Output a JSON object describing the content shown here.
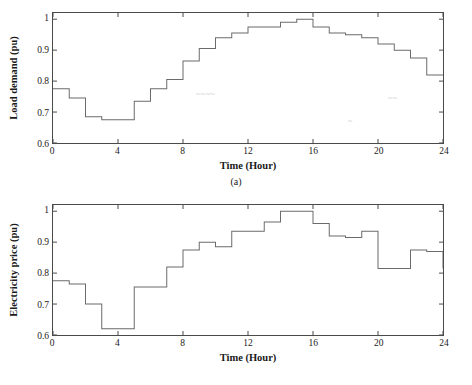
{
  "figure": {
    "panels": [
      {
        "id": "a",
        "caption": "(a)",
        "xlabel": "Time (Hour)",
        "ylabel": "Load demand (pu)",
        "xticks": [
          "0",
          "4",
          "8",
          "12",
          "16",
          "20",
          "24"
        ],
        "yticks": [
          "0.6",
          "0.7",
          "0.8",
          "0.9",
          "1"
        ],
        "artifacts": [
          {
            "text": "~~~~",
            "left": 196,
            "top": 86
          },
          {
            "text": "~~",
            "left": 388,
            "top": 90
          },
          {
            "text": "~",
            "left": 348,
            "top": 113
          }
        ]
      },
      {
        "id": "b",
        "caption": "(b)",
        "xlabel": "Time (Hour)",
        "ylabel": "Electricity price (pu)",
        "xticks": [
          "0",
          "4",
          "8",
          "12",
          "16",
          "20",
          "24"
        ],
        "yticks": [
          "0.6",
          "0.7",
          "0.8",
          "0.9",
          "1"
        ],
        "artifacts": []
      }
    ]
  },
  "chart_data": [
    {
      "type": "line",
      "id": "a",
      "title": "",
      "subtitle": "(a)",
      "xlabel": "Time (Hour)",
      "ylabel": "Load demand (pu)",
      "xlim": [
        0,
        24
      ],
      "ylim": [
        0.6,
        1.02
      ],
      "xticks": [
        0,
        4,
        8,
        12,
        16,
        20,
        24
      ],
      "yticks": [
        0.6,
        0.7,
        0.8,
        0.9,
        1.0
      ],
      "grid": false,
      "legend": "none",
      "drawstyle": "steps-post",
      "line_color": "#6b6b6b",
      "x": [
        0,
        1,
        2,
        3,
        4,
        5,
        6,
        7,
        8,
        9,
        10,
        11,
        12,
        13,
        14,
        15,
        16,
        17,
        18,
        19,
        20,
        21,
        22,
        23,
        24
      ],
      "values": [
        0.775,
        0.745,
        0.685,
        0.675,
        0.675,
        0.735,
        0.775,
        0.805,
        0.865,
        0.905,
        0.94,
        0.955,
        0.975,
        0.975,
        0.99,
        1.0,
        0.975,
        0.955,
        0.95,
        0.94,
        0.92,
        0.9,
        0.875,
        0.82,
        0.82
      ]
    },
    {
      "type": "line",
      "id": "b",
      "title": "",
      "subtitle": "(b)",
      "xlabel": "Time (Hour)",
      "ylabel": "Electricity price (pu)",
      "xlim": [
        0,
        24
      ],
      "ylim": [
        0.6,
        1.02
      ],
      "xticks": [
        0,
        4,
        8,
        12,
        16,
        20,
        24
      ],
      "yticks": [
        0.6,
        0.7,
        0.8,
        0.9,
        1.0
      ],
      "grid": false,
      "legend": "none",
      "drawstyle": "steps-post",
      "line_color": "#6b6b6b",
      "x": [
        0,
        1,
        2,
        3,
        4,
        5,
        6,
        7,
        8,
        9,
        10,
        11,
        12,
        13,
        14,
        15,
        16,
        17,
        18,
        19,
        20,
        21,
        22,
        23,
        24
      ],
      "values": [
        0.775,
        0.765,
        0.7,
        0.62,
        0.62,
        0.755,
        0.755,
        0.82,
        0.875,
        0.9,
        0.885,
        0.935,
        0.935,
        0.965,
        1.0,
        1.0,
        0.96,
        0.92,
        0.915,
        0.935,
        0.815,
        0.815,
        0.875,
        0.87,
        0.815
      ]
    }
  ]
}
